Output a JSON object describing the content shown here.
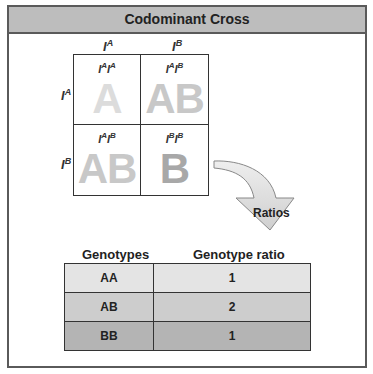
{
  "title": "Codominant Cross",
  "punnett": {
    "col_alleles": [
      {
        "base": "I",
        "sup": "A"
      },
      {
        "base": "I",
        "sup": "B"
      }
    ],
    "row_alleles": [
      {
        "base": "I",
        "sup": "A"
      },
      {
        "base": "I",
        "sup": "B"
      }
    ],
    "cells": [
      {
        "g1": "I",
        "s1": "A",
        "g2": "I",
        "s2": "A",
        "phenotype": "A",
        "color": "#dcdcdc"
      },
      {
        "g1": "I",
        "s1": "A",
        "g2": "I",
        "s2": "B",
        "phenotype": "AB",
        "color": "#c8c8c8"
      },
      {
        "g1": "I",
        "s1": "A",
        "g2": "I",
        "s2": "B",
        "phenotype": "AB",
        "color": "#c8c8c8"
      },
      {
        "g1": "I",
        "s1": "B",
        "g2": "I",
        "s2": "B",
        "phenotype": "B",
        "color": "#a8a8a8"
      }
    ]
  },
  "arrow_label": "Ratios",
  "ratio_table": {
    "headers": [
      "Genotypes",
      "Genotype ratio"
    ],
    "rows": [
      {
        "genotype": "AA",
        "ratio": "1",
        "bg": "#e4e4e4"
      },
      {
        "genotype": "AB",
        "ratio": "2",
        "bg": "#cdcdcd"
      },
      {
        "genotype": "BB",
        "ratio": "1",
        "bg": "#b4b4b4"
      }
    ]
  }
}
